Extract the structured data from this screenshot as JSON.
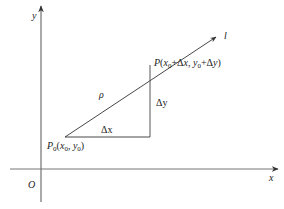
{
  "diagram": {
    "title": "",
    "colors": {
      "axis": "#555555",
      "line": "#333333",
      "background": "#ffffff"
    },
    "axes": {
      "x_label": "x",
      "y_label": "y",
      "origin_label": "O"
    },
    "points": {
      "p0": {
        "name": "P",
        "sub": "0",
        "coords_text": "(x",
        "coords_sub1": "0",
        "coords_mid": ", y",
        "coords_sub2": "0",
        "coords_end": ")"
      },
      "p": {
        "name": "P",
        "text_a": "(x",
        "sub_a": "0",
        "text_b": "+Δx, y",
        "sub_b": "0",
        "text_c": "+Δy)"
      }
    },
    "labels": {
      "ray": "l",
      "distance": "ρ",
      "delta_x": "Δx",
      "delta_y": "Δy"
    }
  }
}
